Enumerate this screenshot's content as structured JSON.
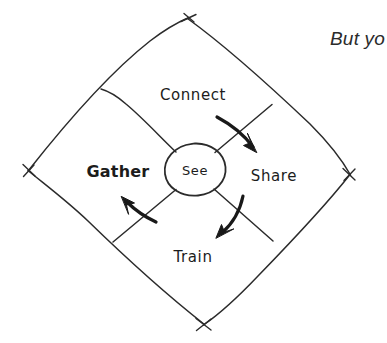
{
  "canvas": {
    "width": 387,
    "height": 343,
    "background": "#ffffff",
    "ink_color": "#2b2b2b",
    "label_color": "#1c1c1c"
  },
  "diagram": {
    "style": "hand-drawn-sketch",
    "shape": "diamond",
    "center_node": {
      "label": "See",
      "shape": "circle"
    },
    "quadrants": [
      {
        "label": "Connect",
        "position": "top",
        "emphasis": "normal"
      },
      {
        "label": "Share",
        "position": "right",
        "emphasis": "normal"
      },
      {
        "label": "Train",
        "position": "bottom",
        "emphasis": "normal"
      },
      {
        "label": "Gather",
        "position": "left",
        "emphasis": "bold"
      }
    ],
    "arrows": [
      {
        "name": "connect-to-share",
        "from": "Connect",
        "to": "Share",
        "direction": "down-right"
      },
      {
        "name": "share-to-train",
        "from": "Share",
        "to": "Train",
        "direction": "down-left"
      },
      {
        "name": "train-to-gather",
        "from": "Train",
        "to": "Gather",
        "direction": "up-left"
      }
    ]
  },
  "caption": {
    "text": "But yo",
    "note": "clipped at right edge"
  }
}
